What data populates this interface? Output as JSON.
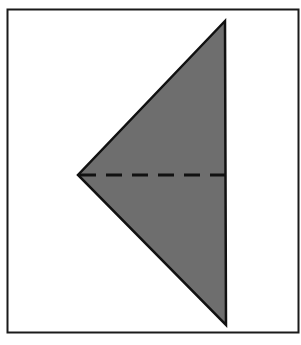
{
  "diagram": {
    "type": "fold-diagram",
    "colors": {
      "background": "#ffffff",
      "frame": "#1a1a1a",
      "triangle_fill": "#6e6e6e",
      "triangle_stroke": "#111111",
      "fold_line": "#111111"
    },
    "frame": {
      "x": 7,
      "y": 9,
      "width": 292,
      "height": 324
    },
    "triangle": {
      "vertices": [
        [
          225,
          21
        ],
        [
          78,
          175
        ],
        [
          226,
          325
        ]
      ]
    },
    "fold_line": {
      "x1": 78,
      "y1": 175,
      "x2": 226,
      "y2": 175,
      "style": "dashed"
    }
  }
}
